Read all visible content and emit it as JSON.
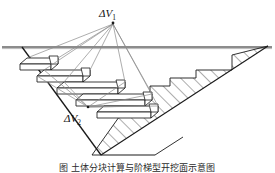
{
  "figure": {
    "domain": "diagram",
    "type": "engineering-cross-section",
    "background_color": "#ffffff",
    "line_color": "#1a1a1a",
    "thin_line_color": "#7a7a7a",
    "hatch_color": "#4a4a4a",
    "width_px": 275,
    "height_px": 173
  },
  "labels": {
    "delta_v1": {
      "symbol": "ΔV",
      "subscript": "1",
      "full": "ΔV₁",
      "x": 113,
      "y": 17
    },
    "delta_v2": {
      "symbol": "ΔV",
      "subscript": "2",
      "full": "ΔV₂",
      "x": 78,
      "y": 122
    }
  },
  "caption": {
    "text": "图          土体分块计算与阶梯型开挖面示意图",
    "visible": "partially-cropped"
  },
  "geometry": {
    "ground_line": {
      "x1": 2,
      "y1": 47,
      "x2": 272,
      "y2": 47
    },
    "v_trench": {
      "left_rim": {
        "x": 22,
        "y": 47
      },
      "bottom": {
        "x": 101,
        "y": 155
      },
      "right_rim": {
        "x": 268,
        "y": 46
      }
    },
    "apex_v1": {
      "x": 113,
      "y": 22
    },
    "apex_v2": {
      "x": 88,
      "y": 108
    },
    "step_count": 5,
    "hatch_spacing_px": 9,
    "hatch_angle_deg": 45
  }
}
